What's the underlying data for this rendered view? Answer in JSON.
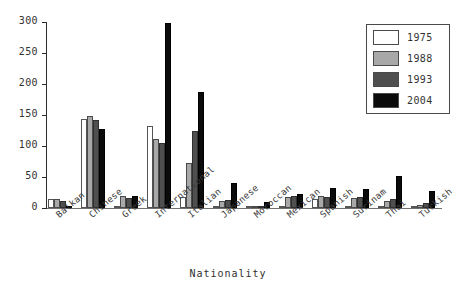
{
  "chart_data": {
    "type": "bar",
    "title": "",
    "xlabel": "Nationality",
    "ylabel": "",
    "ylim": [
      0,
      300
    ],
    "yticks": [
      0,
      50,
      100,
      150,
      200,
      250,
      300
    ],
    "grid": false,
    "legend_position": "top-right",
    "categories": [
      "Balkan",
      "Chinese",
      "Greek",
      "International",
      "Italian",
      "Japanese",
      "Moroccan",
      "Mexican",
      "Spanish",
      "Surinam",
      "Thai",
      "Turkish"
    ],
    "series": [
      {
        "name": "1975",
        "color": "#ffffff",
        "values": [
          14,
          143,
          2,
          133,
          18,
          3,
          1,
          0,
          14,
          2,
          0,
          1
        ]
      },
      {
        "name": "1988",
        "color": "#a8a8a8",
        "values": [
          15,
          148,
          20,
          111,
          72,
          12,
          2,
          17,
          20,
          16,
          12,
          5
        ]
      },
      {
        "name": "1993",
        "color": "#4f4f4f",
        "values": [
          12,
          142,
          16,
          105,
          124,
          13,
          3,
          19,
          17,
          17,
          15,
          8
        ]
      },
      {
        "name": "2004",
        "color": "#0b0b0b",
        "values": [
          4,
          127,
          20,
          298,
          187,
          40,
          10,
          22,
          32,
          30,
          51,
          28
        ]
      }
    ]
  },
  "legend": {
    "items": [
      {
        "label": "1975"
      },
      {
        "label": "1988"
      },
      {
        "label": "1993"
      },
      {
        "label": "2004"
      }
    ]
  }
}
